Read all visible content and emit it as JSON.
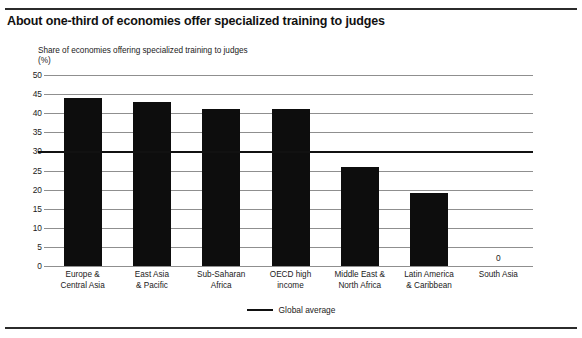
{
  "figure": {
    "title": "About one-third of economies offer specialized training to judges",
    "axis_caption": "Share of economies offering specialized training to judges",
    "axis_unit": "(%)"
  },
  "legend": {
    "items": [
      {
        "label": "Global average",
        "marker": "line",
        "color": "#111111"
      }
    ]
  },
  "chart_data": {
    "type": "bar",
    "title": "About one-third of economies offer specialized training to judges",
    "subtitle": "Share of economies offering specialized training to judges",
    "xlabel": "",
    "ylabel": "(%)",
    "ylim": [
      0,
      50
    ],
    "yticks": [
      0,
      5,
      10,
      15,
      20,
      25,
      30,
      35,
      40,
      45,
      50
    ],
    "ytick_labels": [
      "0",
      "5",
      "10",
      "15",
      "20",
      "25",
      "30",
      "35",
      "40",
      "45",
      "50"
    ],
    "grid": true,
    "legend_position": "bottom-center",
    "bar_color": "#0d0d0d",
    "categories": [
      "Europe & Central Asia",
      "East Asia & Pacific",
      "Sub-Saharan Africa",
      "OECD high income",
      "Middle East & North Africa",
      "Latin America & Caribbean",
      "South Asia"
    ],
    "category_lines": [
      [
        "Europe &",
        "Central Asia"
      ],
      [
        "East Asia",
        "& Pacific"
      ],
      [
        "Sub-Saharan",
        "Africa"
      ],
      [
        "OECD high",
        "income"
      ],
      [
        "Middle East &",
        "North Africa"
      ],
      [
        "Latin America",
        "& Caribbean"
      ],
      [
        "South Asia"
      ]
    ],
    "values": [
      44,
      43,
      41,
      41,
      26,
      19,
      0
    ],
    "data_labels": {
      "6": "0"
    },
    "reference_line": {
      "name": "Global average",
      "value": 30,
      "color": "#111111"
    }
  }
}
